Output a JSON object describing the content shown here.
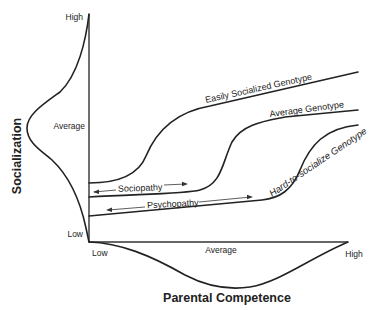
{
  "diagram": {
    "y_axis": {
      "title": "Socialization",
      "tick_high": "High",
      "tick_average": "Average",
      "tick_low": "Low"
    },
    "x_axis": {
      "title": "Parental Competence",
      "tick_low": "Low",
      "tick_average": "Average",
      "tick_high": "High"
    },
    "curves": {
      "easily_socialized": "Easily Socialized Genotype",
      "average": "Average Genotype",
      "hard_to_socialize": "Hard-to-socialize Genotype"
    },
    "regions": {
      "sociopathy": "Sociopathy",
      "psychopathy": "Psychopathy"
    },
    "distributions": {
      "y_distribution": "normal distribution of socialization (bell curve along vertical axis)",
      "x_distribution": "normal distribution of parental competence (bell curve along horizontal axis)"
    },
    "colors": {
      "line": "#222222",
      "background": "#ffffff"
    }
  }
}
